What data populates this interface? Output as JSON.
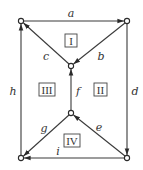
{
  "diagram": {
    "type": "directed-graph",
    "nodes": [
      {
        "id": "TL",
        "x": 21,
        "y": 21
      },
      {
        "id": "TR",
        "x": 127,
        "y": 21
      },
      {
        "id": "MT",
        "x": 71,
        "y": 66
      },
      {
        "id": "MB",
        "x": 71,
        "y": 113
      },
      {
        "id": "BL",
        "x": 21,
        "y": 158
      },
      {
        "id": "BR",
        "x": 127,
        "y": 158
      }
    ],
    "edges": [
      {
        "label": "a",
        "from": "TL",
        "to": "TR"
      },
      {
        "label": "b",
        "from": "TR",
        "to": "MT"
      },
      {
        "label": "c",
        "from": "MT",
        "to": "TL"
      },
      {
        "label": "d",
        "from": "TR",
        "to": "BR"
      },
      {
        "label": "e",
        "from": "BR",
        "to": "MB"
      },
      {
        "label": "f",
        "from": "MB",
        "to": "MT"
      },
      {
        "label": "g",
        "from": "MB",
        "to": "BL"
      },
      {
        "label": "h",
        "from": "BL",
        "to": "TL"
      },
      {
        "label": "i",
        "from": "BR",
        "to": "BL"
      }
    ],
    "regions": [
      {
        "label": "I"
      },
      {
        "label": "II"
      },
      {
        "label": "III"
      },
      {
        "label": "IV"
      }
    ],
    "colors": {
      "line": "#3a3a3a",
      "text": "#333333",
      "background": "#ffffff"
    }
  }
}
